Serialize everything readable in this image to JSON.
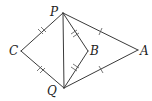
{
  "diagram": {
    "type": "geometry",
    "points": {
      "P": {
        "label": "P",
        "x": 63,
        "y": 13
      },
      "Q": {
        "label": "Q",
        "x": 64,
        "y": 88
      },
      "C": {
        "label": "C",
        "x": 21,
        "y": 51
      },
      "B": {
        "label": "B",
        "x": 88,
        "y": 51
      },
      "A": {
        "label": "A",
        "x": 138,
        "y": 50
      }
    },
    "segments": [
      {
        "from": "P",
        "to": "C",
        "ticks": 2
      },
      {
        "from": "C",
        "to": "Q",
        "ticks": 2
      },
      {
        "from": "P",
        "to": "B",
        "ticks": 2
      },
      {
        "from": "B",
        "to": "Q",
        "ticks": 2
      },
      {
        "from": "P",
        "to": "A",
        "ticks": 1
      },
      {
        "from": "Q",
        "to": "A",
        "ticks": 1
      },
      {
        "from": "P",
        "to": "Q",
        "ticks": 0
      }
    ],
    "colors": {
      "stroke": "#3a3a3a",
      "label": "#222222"
    }
  }
}
